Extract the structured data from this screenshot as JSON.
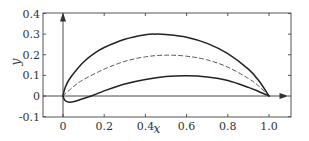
{
  "chart_data": {
    "type": "line",
    "title": "",
    "xlabel": "x",
    "ylabel": "y",
    "xlim": [
      -0.16,
      1.1
    ],
    "ylim": [
      -0.1,
      0.4
    ],
    "grid": false,
    "legend": null,
    "x_ticks": [
      0,
      0.2,
      0.4,
      0.6,
      0.8,
      1.0
    ],
    "x_tick_labels": [
      "0",
      "0.2",
      "0.4",
      "0.6",
      "0.8",
      "1.0"
    ],
    "y_ticks": [
      -0.1,
      0,
      0.1,
      0.2,
      0.3,
      0.4
    ],
    "y_tick_labels": [
      "-0.1",
      "0",
      "0.1",
      "0.2",
      "0.3",
      "0.4"
    ],
    "annotations": [
      "x-axis arrow at y=0 pointing right",
      "y-axis arrow at x=0 pointing up"
    ],
    "series": [
      {
        "name": "upper surface",
        "style": "solid",
        "color": "#222222",
        "x": [
          0,
          0.01,
          0.03,
          0.06,
          0.1,
          0.15,
          0.2,
          0.3,
          0.4,
          0.45,
          0.5,
          0.6,
          0.7,
          0.8,
          0.9,
          0.95,
          1.0
        ],
        "y": [
          0,
          0.04,
          0.08,
          0.12,
          0.165,
          0.205,
          0.235,
          0.275,
          0.297,
          0.3,
          0.298,
          0.285,
          0.255,
          0.205,
          0.13,
          0.075,
          0
        ]
      },
      {
        "name": "camber line",
        "style": "dashed",
        "color": "#555555",
        "x": [
          0,
          0.05,
          0.1,
          0.2,
          0.3,
          0.4,
          0.5,
          0.6,
          0.7,
          0.8,
          0.9,
          0.95,
          1.0
        ],
        "y": [
          0,
          0.045,
          0.08,
          0.13,
          0.168,
          0.19,
          0.198,
          0.193,
          0.175,
          0.14,
          0.085,
          0.048,
          0
        ]
      },
      {
        "name": "lower surface",
        "style": "solid",
        "color": "#222222",
        "x": [
          0,
          0.01,
          0.03,
          0.06,
          0.1,
          0.15,
          0.2,
          0.3,
          0.4,
          0.5,
          0.6,
          0.7,
          0.8,
          0.9,
          0.95,
          1.0
        ],
        "y": [
          0,
          -0.022,
          -0.03,
          -0.025,
          -0.012,
          0.005,
          0.025,
          0.058,
          0.08,
          0.094,
          0.098,
          0.092,
          0.075,
          0.042,
          0.022,
          0
        ]
      }
    ]
  },
  "layout": {
    "frame": {
      "left": 43,
      "right": 291,
      "top": 13,
      "bottom": 117
    },
    "x_map": {
      "v0": 0,
      "p0": 63,
      "v1": 1.0,
      "p1": 269
    },
    "y_map": {
      "v0": 0,
      "p0": 96,
      "v1": 0.4,
      "p1": 13.5
    },
    "axis_arrow_x_end": 1.08,
    "axis_arrow_y_end": 0.395,
    "axis_color": "#333333",
    "frame_color": "#555555"
  }
}
